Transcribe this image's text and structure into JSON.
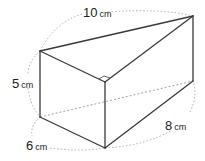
{
  "figure": {
    "type": "triangular-prism",
    "vertices": {
      "A": [
        40,
        51
      ],
      "B": [
        193,
        16
      ],
      "C": [
        105,
        82
      ],
      "D": [
        40,
        117
      ],
      "E": [
        105,
        148
      ],
      "F": [
        193,
        81
      ]
    },
    "labels": [
      {
        "id": "hyp",
        "value": "10",
        "unit": "cm",
        "x": 83,
        "y": 4
      },
      {
        "id": "height",
        "value": "5",
        "unit": "cm",
        "x": 12,
        "y": 74
      },
      {
        "id": "base",
        "value": "6",
        "unit": "cm",
        "x": 26,
        "y": 139
      },
      {
        "id": "length",
        "value": "8",
        "unit": "cm",
        "x": 165,
        "y": 117
      }
    ],
    "right_angle_marker": "at C between CA and CB"
  }
}
